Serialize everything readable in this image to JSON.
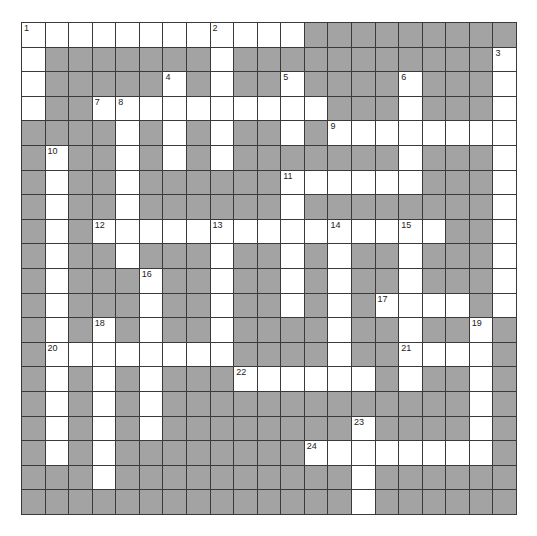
{
  "puzzle": {
    "columns": 21,
    "rows": 20,
    "colors": {
      "block": "#a3a3a3",
      "open": "#ffffff",
      "line": "#3a3a3a"
    },
    "grid": [
      "............#########",
      ".#######.###########.",
      ".#####.#.##.####.###.",
      ".##..........###.###.",
      "####.#.#.##.#........",
      "#.##.#.#.#######.###.",
      "#.##.######......###.",
      "#.##.######.########.",
      "#.#...............##.",
      "#.##.###.##.#.##.###.",
      "#.###.##.##.#.##.###.",
      "#.###.##.##.#.#....#.",
      "#.#.#.##.####.##.##.#",
      "#........####.##....#",
      "#.#.#.###......#.##.#",
      "#.#.#.#############.#",
      "#.#.#.########.####.#",
      "#.#.########........#",
      "###.##########.######",
      "##############.######"
    ],
    "numbers": [
      {
        "n": "1",
        "r": 0,
        "c": 0
      },
      {
        "n": "2",
        "r": 0,
        "c": 8
      },
      {
        "n": "3",
        "r": 1,
        "c": 20
      },
      {
        "n": "4",
        "r": 2,
        "c": 6
      },
      {
        "n": "5",
        "r": 2,
        "c": 11
      },
      {
        "n": "6",
        "r": 2,
        "c": 16
      },
      {
        "n": "7",
        "r": 3,
        "c": 3
      },
      {
        "n": "8",
        "r": 3,
        "c": 4
      },
      {
        "n": "9",
        "r": 4,
        "c": 13
      },
      {
        "n": "10",
        "r": 5,
        "c": 1
      },
      {
        "n": "11",
        "r": 6,
        "c": 11
      },
      {
        "n": "12",
        "r": 8,
        "c": 3
      },
      {
        "n": "13",
        "r": 8,
        "c": 8
      },
      {
        "n": "14",
        "r": 8,
        "c": 13
      },
      {
        "n": "15",
        "r": 8,
        "c": 16
      },
      {
        "n": "16",
        "r": 10,
        "c": 5
      },
      {
        "n": "17",
        "r": 11,
        "c": 15
      },
      {
        "n": "18",
        "r": 12,
        "c": 3
      },
      {
        "n": "19",
        "r": 12,
        "c": 19
      },
      {
        "n": "20",
        "r": 13,
        "c": 1
      },
      {
        "n": "21",
        "r": 13,
        "c": 16
      },
      {
        "n": "22",
        "r": 14,
        "c": 9
      },
      {
        "n": "23",
        "r": 16,
        "c": 14
      },
      {
        "n": "24",
        "r": 17,
        "c": 12
      }
    ]
  }
}
